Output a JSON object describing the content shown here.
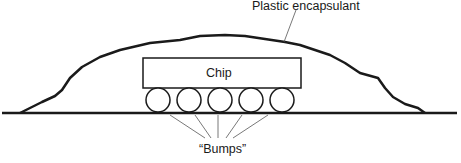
{
  "diagram": {
    "labels": {
      "encapsulant": "Plastic encapsulant",
      "chip": "Chip",
      "bumps": "“Bumps”"
    },
    "bump_count": 5,
    "colors": {
      "stroke": "#1a1a1a",
      "leader": "#555555",
      "background": "#ffffff"
    }
  }
}
